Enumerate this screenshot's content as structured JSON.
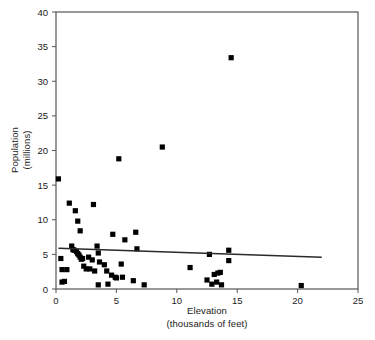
{
  "chart_data": {
    "type": "scatter",
    "title": "",
    "xlabel": "Elevation",
    "xlabel_line2": "(thousands of feet)",
    "ylabel": "Population",
    "ylabel_line2": "(millions)",
    "xlim": [
      0,
      25
    ],
    "ylim": [
      0,
      40
    ],
    "xticks": [
      0,
      5,
      10,
      15,
      20,
      25
    ],
    "yticks": [
      0,
      5,
      10,
      15,
      20,
      25,
      30,
      35,
      40
    ],
    "xtick_labels": [
      "0",
      "5",
      "10",
      "15",
      "20",
      "25"
    ],
    "ytick_labels": [
      "0",
      "5",
      "10",
      "15",
      "20",
      "25",
      "30",
      "35",
      "40"
    ],
    "grid": false,
    "legend": "none",
    "marker": "square",
    "marker_color": "#000000",
    "frame_color": "#555555",
    "points": [
      [
        0.2,
        15.9
      ],
      [
        0.4,
        4.4
      ],
      [
        0.5,
        2.8
      ],
      [
        0.5,
        1.0
      ],
      [
        0.7,
        1.1
      ],
      [
        0.9,
        2.8
      ],
      [
        1.1,
        12.4
      ],
      [
        1.3,
        6.2
      ],
      [
        1.4,
        5.7
      ],
      [
        1.5,
        5.6
      ],
      [
        1.6,
        11.3
      ],
      [
        1.7,
        5.4
      ],
      [
        1.8,
        9.8
      ],
      [
        1.8,
        5.1
      ],
      [
        1.9,
        4.9
      ],
      [
        2.0,
        8.4
      ],
      [
        2.0,
        4.6
      ],
      [
        2.1,
        4.3
      ],
      [
        2.2,
        4.4
      ],
      [
        2.3,
        3.3
      ],
      [
        2.5,
        2.9
      ],
      [
        2.7,
        4.6
      ],
      [
        2.8,
        2.9
      ],
      [
        3.0,
        4.2
      ],
      [
        3.1,
        12.2
      ],
      [
        3.2,
        2.6
      ],
      [
        3.4,
        6.2
      ],
      [
        3.5,
        5.2
      ],
      [
        3.5,
        0.6
      ],
      [
        3.6,
        3.9
      ],
      [
        4.0,
        3.5
      ],
      [
        4.2,
        2.6
      ],
      [
        4.3,
        0.7
      ],
      [
        4.6,
        2.0
      ],
      [
        4.7,
        7.9
      ],
      [
        4.9,
        1.7
      ],
      [
        5.0,
        1.6
      ],
      [
        5.2,
        18.8
      ],
      [
        5.4,
        3.6
      ],
      [
        5.5,
        1.7
      ],
      [
        5.7,
        7.1
      ],
      [
        6.4,
        1.2
      ],
      [
        6.6,
        8.2
      ],
      [
        6.7,
        5.8
      ],
      [
        7.3,
        0.6
      ],
      [
        8.8,
        20.5
      ],
      [
        11.1,
        3.1
      ],
      [
        12.5,
        1.3
      ],
      [
        12.7,
        5.0
      ],
      [
        12.9,
        0.7
      ],
      [
        13.1,
        2.1
      ],
      [
        13.3,
        1.0
      ],
      [
        13.4,
        2.3
      ],
      [
        13.6,
        2.4
      ],
      [
        13.7,
        0.6
      ],
      [
        14.3,
        5.6
      ],
      [
        14.3,
        4.1
      ],
      [
        14.5,
        33.4
      ],
      [
        20.3,
        0.5
      ]
    ],
    "trend_line": {
      "type": "linear",
      "x_start": 0.2,
      "y_start": 5.9,
      "x_end": 22.0,
      "y_end": 4.6,
      "color": "#2a2a2a"
    }
  }
}
